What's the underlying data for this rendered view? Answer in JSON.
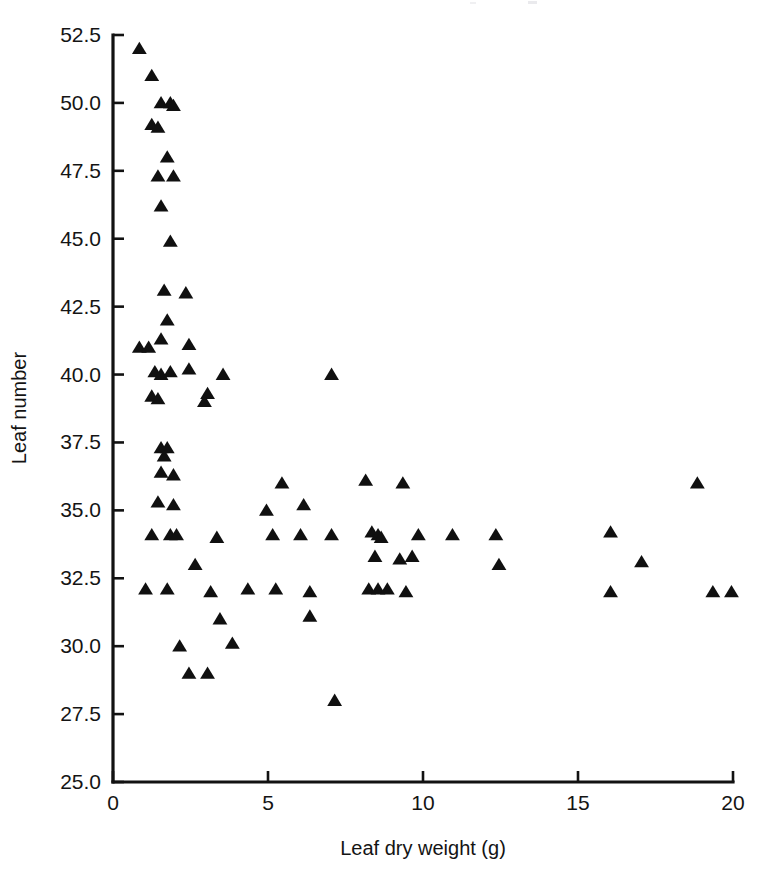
{
  "chart_data": {
    "type": "scatter",
    "title": "",
    "subtitle": "",
    "xlabel": "Leaf dry weight (g)",
    "ylabel": "Leaf number",
    "xlim": [
      0,
      20
    ],
    "ylim": [
      25.0,
      52.5
    ],
    "xticks": [
      0,
      5,
      10,
      15,
      20
    ],
    "xticklabels": [
      "0",
      "5",
      "10",
      "15",
      "20"
    ],
    "yticks": [
      25.0,
      27.5,
      30.0,
      32.5,
      35.0,
      37.5,
      40.0,
      42.5,
      45.0,
      47.5,
      50.0,
      52.5
    ],
    "yticklabels": [
      "25.0",
      "27.5",
      "30.0",
      "32.5",
      "35.0",
      "37.5",
      "40.0",
      "42.5",
      "45.0",
      "47.5",
      "50.0",
      "52.5"
    ],
    "grid": false,
    "legend": null,
    "marker": "triangle-up",
    "marker_color": "#101010",
    "marker_size": 13,
    "series": [
      {
        "name": "Leaf number vs leaf dry weight",
        "points": [
          [
            0.85,
            52.0
          ],
          [
            1.25,
            51.0
          ],
          [
            1.55,
            50.0
          ],
          [
            1.85,
            50.0
          ],
          [
            1.95,
            49.9
          ],
          [
            1.25,
            49.2
          ],
          [
            1.45,
            49.1
          ],
          [
            1.75,
            48.0
          ],
          [
            1.45,
            47.3
          ],
          [
            1.95,
            47.3
          ],
          [
            1.55,
            46.2
          ],
          [
            1.85,
            44.9
          ],
          [
            1.65,
            43.1
          ],
          [
            2.35,
            43.0
          ],
          [
            1.75,
            42.0
          ],
          [
            1.55,
            41.3
          ],
          [
            0.85,
            41.0
          ],
          [
            1.15,
            41.0
          ],
          [
            2.45,
            41.1
          ],
          [
            1.35,
            40.1
          ],
          [
            1.55,
            40.0
          ],
          [
            1.85,
            40.1
          ],
          [
            2.45,
            40.2
          ],
          [
            3.55,
            40.0
          ],
          [
            7.05,
            40.0
          ],
          [
            1.25,
            39.2
          ],
          [
            1.45,
            39.1
          ],
          [
            3.05,
            39.3
          ],
          [
            2.95,
            39.0
          ],
          [
            1.55,
            37.3
          ],
          [
            1.75,
            37.3
          ],
          [
            1.65,
            37.0
          ],
          [
            1.55,
            36.4
          ],
          [
            1.95,
            36.3
          ],
          [
            5.45,
            36.0
          ],
          [
            8.15,
            36.1
          ],
          [
            9.35,
            36.0
          ],
          [
            1.45,
            35.3
          ],
          [
            1.95,
            35.2
          ],
          [
            4.95,
            35.0
          ],
          [
            6.15,
            35.2
          ],
          [
            1.25,
            34.1
          ],
          [
            1.85,
            34.1
          ],
          [
            2.05,
            34.1
          ],
          [
            3.35,
            34.0
          ],
          [
            5.15,
            34.1
          ],
          [
            6.05,
            34.1
          ],
          [
            7.05,
            34.1
          ],
          [
            8.35,
            34.2
          ],
          [
            8.55,
            34.1
          ],
          [
            8.65,
            34.0
          ],
          [
            9.85,
            34.1
          ],
          [
            10.95,
            34.1
          ],
          [
            12.35,
            34.1
          ],
          [
            16.05,
            34.2
          ],
          [
            2.65,
            33.0
          ],
          [
            8.45,
            33.3
          ],
          [
            9.25,
            33.2
          ],
          [
            9.65,
            33.3
          ],
          [
            12.45,
            33.0
          ],
          [
            17.05,
            33.1
          ],
          [
            18.85,
            36.0
          ],
          [
            1.05,
            32.1
          ],
          [
            1.75,
            32.1
          ],
          [
            3.15,
            32.0
          ],
          [
            4.35,
            32.1
          ],
          [
            5.25,
            32.1
          ],
          [
            6.35,
            32.0
          ],
          [
            8.25,
            32.1
          ],
          [
            8.55,
            32.1
          ],
          [
            8.85,
            32.1
          ],
          [
            9.45,
            32.0
          ],
          [
            16.05,
            32.0
          ],
          [
            19.35,
            32.0
          ],
          [
            19.95,
            32.0
          ],
          [
            3.45,
            31.0
          ],
          [
            6.35,
            31.1
          ],
          [
            2.15,
            30.0
          ],
          [
            3.85,
            30.1
          ],
          [
            2.45,
            29.0
          ],
          [
            3.05,
            29.0
          ],
          [
            7.15,
            28.0
          ]
        ]
      }
    ]
  }
}
